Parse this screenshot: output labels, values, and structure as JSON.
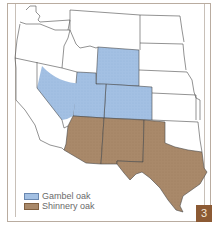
{
  "figure": {
    "number": "3",
    "region": "Western United States"
  },
  "legend": {
    "items": [
      {
        "label": "Gambel oak",
        "color": "#a3c0e3"
      },
      {
        "label": "Shinnery oak",
        "color": "#a9896a"
      }
    ]
  },
  "colors": {
    "gambel_oak": "#a3c0e3",
    "shinnery_oak": "#a9896a",
    "state_border": "#4a4a4a",
    "frame_border": "#b9aca0",
    "badge_bg": "#8c5a34"
  },
  "map": {
    "gambel_oak_states": [
      "Utah",
      "Colorado",
      "Wyoming",
      "Eastern Nevada"
    ],
    "shinnery_oak_states": [
      "Arizona",
      "New Mexico",
      "Texas"
    ]
  }
}
